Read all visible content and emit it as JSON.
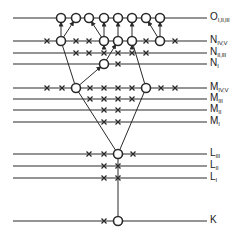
{
  "diagram": {
    "colors": {
      "line": "#2a2a2a",
      "background": "#ffffff"
    },
    "line_x_start": 13,
    "line_x_end": 207,
    "levels": [
      {
        "id": "O",
        "letter": "O",
        "sub": "I,II,III",
        "y": 18
      },
      {
        "id": "N45",
        "letter": "N",
        "sub": "IV,V",
        "y": 41
      },
      {
        "id": "N23",
        "letter": "N",
        "sub": "II,III",
        "y": 53
      },
      {
        "id": "N1",
        "letter": "N",
        "sub": "I",
        "y": 64
      },
      {
        "id": "M45",
        "letter": "M",
        "sub": "IV,V",
        "y": 88
      },
      {
        "id": "M3",
        "letter": "M",
        "sub": "III",
        "y": 99
      },
      {
        "id": "M2",
        "letter": "M",
        "sub": "II",
        "y": 110
      },
      {
        "id": "M1",
        "letter": "M",
        "sub": "I",
        "y": 122
      },
      {
        "id": "L3",
        "letter": "L",
        "sub": "III",
        "y": 154
      },
      {
        "id": "L2",
        "letter": "L",
        "sub": "II",
        "y": 166
      },
      {
        "id": "L1",
        "letter": "L",
        "sub": "I",
        "y": 178
      },
      {
        "id": "K",
        "letter": "K",
        "sub": "",
        "y": 221
      }
    ],
    "circles": [
      {
        "level": "O",
        "x": 61
      },
      {
        "level": "O",
        "x": 76
      },
      {
        "level": "O",
        "x": 89
      },
      {
        "level": "O",
        "x": 104
      },
      {
        "level": "O",
        "x": 118
      },
      {
        "level": "O",
        "x": 132
      },
      {
        "level": "O",
        "x": 146
      },
      {
        "level": "O",
        "x": 160
      },
      {
        "level": "N45",
        "x": 61
      },
      {
        "level": "N45",
        "x": 104
      },
      {
        "level": "N45",
        "x": 118
      },
      {
        "level": "N45",
        "x": 132
      },
      {
        "level": "N45",
        "x": 160
      },
      {
        "level": "N1",
        "x": 104
      },
      {
        "level": "M45",
        "x": 76
      },
      {
        "level": "M45",
        "x": 146
      },
      {
        "level": "L3",
        "x": 118
      },
      {
        "level": "K",
        "x": 118
      }
    ],
    "crosses": [
      {
        "level": "N45",
        "xs": [
          47,
          76,
          89,
          146,
          175
        ]
      },
      {
        "level": "N23",
        "xs": [
          76,
          89,
          104,
          118,
          132,
          146
        ]
      },
      {
        "level": "N1",
        "xs": [
          118
        ]
      },
      {
        "level": "M45",
        "xs": [
          47,
          62,
          90,
          104,
          118,
          132,
          161,
          175
        ]
      },
      {
        "level": "M3",
        "xs": [
          90,
          104,
          118,
          132
        ]
      },
      {
        "level": "M2",
        "xs": [
          104,
          118
        ]
      },
      {
        "level": "M1",
        "xs": [
          104,
          118
        ]
      },
      {
        "level": "L3",
        "xs": [
          89,
          104,
          133
        ]
      },
      {
        "level": "L2",
        "xs": [
          104,
          118
        ]
      },
      {
        "level": "L1",
        "xs": [
          104,
          118
        ]
      },
      {
        "level": "K",
        "xs": [
          104
        ]
      }
    ],
    "transitions": [
      {
        "from": [
          61,
          41
        ],
        "to": [
          61,
          18
        ]
      },
      {
        "from": [
          61,
          41
        ],
        "to": [
          76,
          18
        ]
      },
      {
        "from": [
          104,
          41
        ],
        "to": [
          89,
          18
        ]
      },
      {
        "from": [
          104,
          41
        ],
        "to": [
          104,
          18
        ]
      },
      {
        "from": [
          118,
          41
        ],
        "to": [
          118,
          18
        ]
      },
      {
        "from": [
          132,
          41
        ],
        "to": [
          132,
          18
        ]
      },
      {
        "from": [
          160,
          41
        ],
        "to": [
          146,
          18
        ]
      },
      {
        "from": [
          160,
          41
        ],
        "to": [
          160,
          18
        ]
      },
      {
        "from": [
          104,
          53
        ],
        "to": [
          104,
          41
        ]
      },
      {
        "from": [
          132,
          53
        ],
        "to": [
          132,
          41
        ]
      },
      {
        "from": [
          104,
          64
        ],
        "to": [
          118,
          41
        ]
      },
      {
        "from": [
          76,
          88
        ],
        "to": [
          104,
          64
        ]
      },
      {
        "from": [
          61,
          41
        ],
        "to": [
          76,
          88
        ],
        "arrow": false
      },
      {
        "from": [
          132,
          41
        ],
        "to": [
          146,
          88
        ],
        "arrow": false
      },
      {
        "from": [
          76,
          88
        ],
        "to": [
          118,
          154
        ],
        "arrow": false
      },
      {
        "from": [
          146,
          88
        ],
        "to": [
          118,
          154
        ],
        "arrow": false
      },
      {
        "from": [
          118,
          221
        ],
        "to": [
          118,
          154
        ],
        "arrow": false
      }
    ]
  }
}
